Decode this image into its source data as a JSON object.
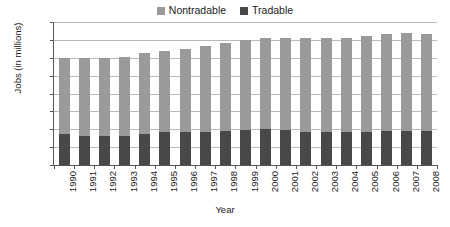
{
  "chart_data": {
    "type": "bar",
    "subtype": "stacked-vertical",
    "title": "",
    "xlabel": "Year",
    "ylabel": "Jobs (in millions)",
    "ylim": [
      0,
      160
    ],
    "yticks": [
      0,
      20,
      40,
      60,
      80,
      100,
      120,
      140,
      160
    ],
    "grid": true,
    "legend_position": "top-center",
    "categories": [
      "1990",
      "1991",
      "1992",
      "1993",
      "1994",
      "1995",
      "1996",
      "1997",
      "1998",
      "1999",
      "2000",
      "2001",
      "2002",
      "2003",
      "2004",
      "2005",
      "2006",
      "2007",
      "2008"
    ],
    "series": [
      {
        "name": "Tradable",
        "color": "#484848",
        "values": [
          35,
          33,
          33,
          33,
          35,
          37,
          37,
          37,
          38,
          39,
          40,
          39,
          37,
          37,
          37,
          37,
          38,
          38,
          38
        ]
      },
      {
        "name": "Nontradable",
        "color": "#9a9a9a",
        "values": [
          85,
          87,
          87,
          88,
          90,
          91,
          93,
          96,
          98,
          101,
          102,
          103,
          105,
          105,
          105,
          107,
          109,
          110,
          109
        ]
      }
    ],
    "totals": [
      120,
      120,
      120,
      121,
      125,
      128,
      130,
      133,
      136,
      140,
      142,
      142,
      142,
      142,
      142,
      144,
      147,
      148,
      147
    ]
  },
  "legend": {
    "items": [
      {
        "label": "Nontradable",
        "color": "#9a9a9a",
        "swatch_name": "nontradable-swatch"
      },
      {
        "label": "Tradable",
        "color": "#484848",
        "swatch_name": "tradable-swatch"
      }
    ]
  },
  "axes": {
    "y_title": "Jobs (in millions)",
    "x_title": "Year",
    "y_tick_labels": [
      "0",
      "20",
      "40",
      "60",
      "80",
      "100",
      "120",
      "140",
      "160"
    ],
    "x_tick_labels": [
      "1990",
      "1991",
      "1992",
      "1993",
      "1994",
      "1995",
      "1996",
      "1997",
      "1998",
      "1999",
      "2000",
      "2001",
      "2002",
      "2003",
      "2004",
      "2005",
      "2006",
      "2007",
      "2008"
    ]
  },
  "colors": {
    "nontradable": "#9a9a9a",
    "tradable": "#484848",
    "gridline": "#b9b9b9",
    "axis": "#555555",
    "background": "#ffffff"
  }
}
